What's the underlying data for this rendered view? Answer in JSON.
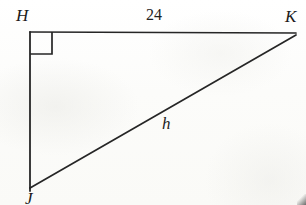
{
  "figure": {
    "type": "right-triangle-diagram",
    "background_color": "#fdfdfb",
    "stroke_color": "#262626",
    "vertices": [
      {
        "name": "H",
        "label": "H",
        "x": 30,
        "y": 32,
        "position": "top-left"
      },
      {
        "name": "K",
        "label": "K",
        "x": 296,
        "y": 33,
        "position": "top-right"
      },
      {
        "name": "J",
        "label": "J",
        "x": 30,
        "y": 188,
        "position": "bottom-left"
      }
    ],
    "sides": [
      {
        "name": "HK",
        "label": "24",
        "from": "H",
        "to": "K",
        "role": "horizontal-leg",
        "label_style": "upright"
      },
      {
        "name": "HJ",
        "label": "",
        "from": "H",
        "to": "J",
        "role": "vertical-leg",
        "label_style": "none"
      },
      {
        "name": "JK",
        "label": "h",
        "from": "J",
        "to": "K",
        "role": "hypotenuse",
        "label_style": "italic"
      }
    ],
    "right_angle": {
      "at_vertex": "H",
      "marker": "square",
      "size": 22
    }
  }
}
